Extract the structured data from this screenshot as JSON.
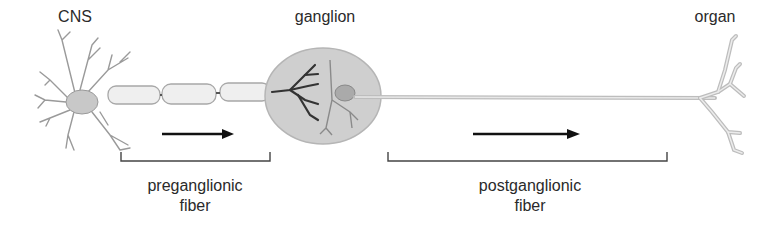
{
  "diagram": {
    "title_labels": {
      "cns": "CNS",
      "ganglion": "ganglion",
      "organ": "organ"
    },
    "fibers": [
      {
        "id": "preganglionic",
        "line1": "preganglionic",
        "line2": "fiber"
      },
      {
        "id": "postganglionic",
        "line1": "postganglionic",
        "line2": "fiber"
      }
    ],
    "colors": {
      "ganglion_fill": "#cfcfcf",
      "ganglion_stroke": "#b5b5b5",
      "axon": "#bdbdbd",
      "dendrite_dark": "#333333",
      "arrow": "#111111",
      "bracket": "#444444",
      "text": "#2a2a2a"
    }
  }
}
